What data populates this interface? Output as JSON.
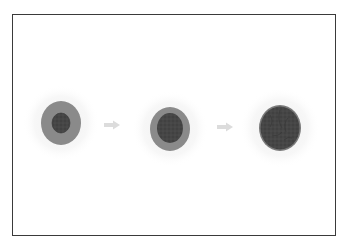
{
  "diagram": {
    "type": "stage-progression",
    "stages": [
      {
        "id": "stage-1",
        "cx": 61,
        "cy": 123,
        "halo_r": 38,
        "outer_rx": 20,
        "outer_ry": 22,
        "inner_rx": 9,
        "inner_ry": 10,
        "outer_color": "#8a8a8a",
        "inner_color": "#4a4a4a"
      },
      {
        "id": "stage-2",
        "cx": 170,
        "cy": 129,
        "halo_r": 38,
        "outer_rx": 20,
        "outer_ry": 22,
        "inner_rx": 13,
        "inner_ry": 15,
        "outer_color": "#8a8a8a",
        "inner_color": "#4c4c4c"
      },
      {
        "id": "stage-3",
        "cx": 280,
        "cy": 128,
        "halo_r": 40,
        "outer_rx": 21,
        "outer_ry": 23,
        "inner_rx": 19,
        "inner_ry": 21,
        "outer_color": "#7a7a7a",
        "inner_color": "#454545"
      }
    ],
    "arrows": [
      {
        "id": "arrow-1",
        "x1": 104,
        "x2": 120,
        "y": 125
      },
      {
        "id": "arrow-2",
        "x1": 217,
        "x2": 233,
        "y": 127
      }
    ],
    "colors": {
      "frame_border": "#3a3a3a",
      "halo": "#f3f3f3",
      "arrow": "#dcdcdc",
      "background": "#ffffff"
    }
  }
}
